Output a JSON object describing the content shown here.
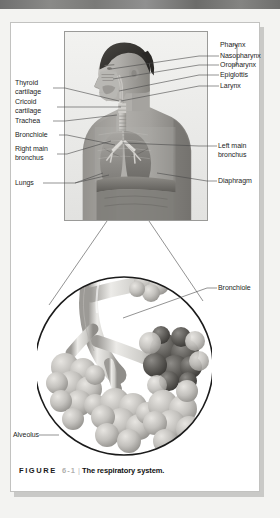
{
  "figure": {
    "caption_label": "FIGURE",
    "caption_number": "6-1",
    "caption_separator": "|",
    "caption_title": "The respiratory system."
  },
  "colors": {
    "page_background": "#ffffff",
    "surround": "#f3f3f1",
    "top_strip": "#7a7a78",
    "label_text": "#1d1d1d",
    "leader_line": "#4a4a4a",
    "caption_number": "#b0b0ae"
  },
  "upper_figure": {
    "description": "Photograph of a man's head and torso in profile with anatomical cutaway of the respiratory tract",
    "labels_left": [
      {
        "id": "thyroid-cartilage",
        "text": "Thyroid\ncartilage"
      },
      {
        "id": "cricoid-cartilage",
        "text": "Cricoid\ncartilage"
      },
      {
        "id": "trachea",
        "text": "Trachea"
      },
      {
        "id": "bronchiole",
        "text": "Bronchiole"
      },
      {
        "id": "right-main-bronchus",
        "text": "Right main\nbronchus"
      },
      {
        "id": "lungs",
        "text": "Lungs"
      }
    ],
    "labels_right": [
      {
        "id": "pharynx",
        "text": "Pharynx"
      },
      {
        "id": "nasopharynx",
        "text": "Nasopharynx"
      },
      {
        "id": "oropharynx",
        "text": "Oropharynx"
      },
      {
        "id": "epiglottis",
        "text": "Epiglottis"
      },
      {
        "id": "larynx",
        "text": "Larynx"
      },
      {
        "id": "left-main-bronchus",
        "text": "Left main\nbronchus"
      },
      {
        "id": "diaphragm",
        "text": "Diaphragm"
      }
    ]
  },
  "inset_figure": {
    "description": "Circular magnified inset showing a bronchiole branching into grape-like alveolar clusters",
    "labels": [
      {
        "id": "bronchiole-inset",
        "text": "Bronchiole"
      },
      {
        "id": "alveolus-inset",
        "text": "Alveolus"
      }
    ]
  }
}
